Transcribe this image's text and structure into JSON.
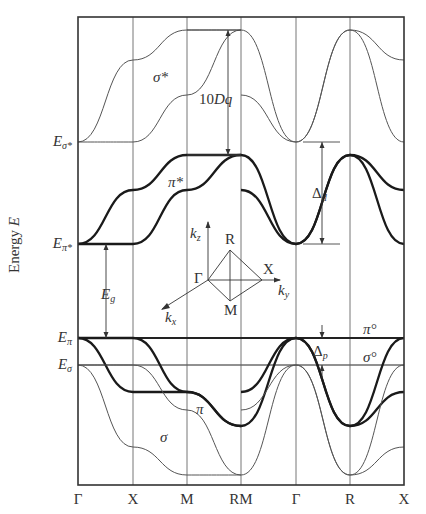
{
  "figure": {
    "axis_label": "Energy",
    "axis_label_symbol": "E",
    "kpoints": [
      "Γ",
      "X",
      "M",
      "RM",
      "Γ",
      "R",
      "X"
    ],
    "kpoint_x": [
      78,
      133,
      187,
      241,
      296,
      350,
      404
    ],
    "energy_levels": [
      {
        "name": "E",
        "sub": "σ*",
        "y": 142
      },
      {
        "name": "E",
        "sub": "π*",
        "y": 244
      },
      {
        "name": "E",
        "sub": "π",
        "y": 338
      },
      {
        "name": "E",
        "sub": "σ",
        "y": 365
      }
    ],
    "band_labels": [
      {
        "text": "σ*",
        "x": 153,
        "y": 78
      },
      {
        "text": "π*",
        "x": 168,
        "y": 183
      },
      {
        "text": "π",
        "x": 196,
        "y": 410
      },
      {
        "text": "σ",
        "x": 160,
        "y": 438
      },
      {
        "text": "π°",
        "x": 363,
        "y": 330
      },
      {
        "text": "σ°",
        "x": 363,
        "y": 358
      }
    ],
    "annotations": {
      "ten_dq": {
        "text": "10Dq",
        "x": 228,
        "y1": 30,
        "y2": 155
      },
      "delta_d": {
        "text": "Δ",
        "sub": "d",
        "x": 322,
        "y1": 142,
        "y2": 244
      },
      "delta_p": {
        "text": "Δ",
        "sub": "p",
        "x": 322,
        "y1": 338,
        "y2": 365
      },
      "e_gap": {
        "text": "E",
        "sub": "g",
        "x": 106,
        "y1": 244,
        "y2": 338
      }
    },
    "inset": {
      "title": "Brillouin zone path",
      "points": [
        "R",
        "Γ",
        "X",
        "M"
      ],
      "axes": [
        "k",
        "k",
        "k"
      ],
      "axes_sub": [
        "z",
        "y",
        "x"
      ]
    }
  },
  "chart_data": {
    "type": "line",
    "title": "",
    "xlabel": "",
    "ylabel": "Energy E",
    "x_ticks": [
      "Γ",
      "X",
      "M",
      "RM",
      "Γ",
      "R",
      "X"
    ],
    "y_levels": [
      "Eσ*",
      "Eπ*",
      "Eπ",
      "Eσ"
    ],
    "grid": "vertical lines at k-points",
    "series": [
      {
        "name": "σ* (1)",
        "style": "thin",
        "segments": [
          [
            142,
            60,
            30,
            30
          ],
          [
            30,
            142,
            30,
            60
          ]
        ]
      },
      {
        "name": "σ* (2)",
        "style": "thin",
        "segments": [
          [
            142,
            142,
            95,
            30
          ],
          [
            95,
            142,
            30,
            142
          ]
        ]
      },
      {
        "name": "π* (1)",
        "style": "thick",
        "segments": [
          [
            244,
            190,
            155,
            155
          ],
          [
            155,
            244,
            155,
            190
          ]
        ]
      },
      {
        "name": "π* (2)",
        "style": "thick",
        "segments": [
          [
            244,
            244,
            190,
            155
          ],
          [
            190,
            244,
            155,
            244
          ]
        ]
      },
      {
        "name": "π (1)",
        "style": "thick",
        "segments": [
          [
            338,
            392,
            392,
            426
          ],
          [
            426,
            338,
            426,
            392
          ]
        ]
      },
      {
        "name": "π (2)",
        "style": "thick",
        "segments": [
          [
            338,
            338,
            392,
            426
          ],
          [
            392,
            338,
            426,
            338
          ]
        ]
      },
      {
        "name": "σ (1)",
        "style": "thin",
        "segments": [
          [
            365,
            447,
            475,
            475
          ],
          [
            475,
            365,
            475,
            447
          ]
        ]
      },
      {
        "name": "σ (2)",
        "style": "thin",
        "segments": [
          [
            365,
            365,
            410,
            475
          ],
          [
            410,
            365,
            475,
            365
          ]
        ]
      }
    ],
    "annotations": [
      "10Dq",
      "Δd",
      "Δp",
      "Eg",
      "σ*",
      "π*",
      "π",
      "σ",
      "π°",
      "σ°"
    ]
  }
}
